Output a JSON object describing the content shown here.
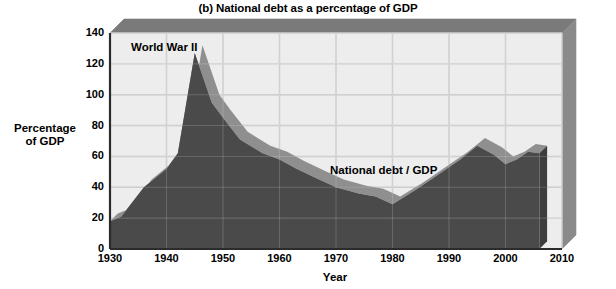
{
  "figure": {
    "title": "(b) National debt as a percentage of GDP",
    "xlabel": "Year",
    "ylabel_line1": "Percentage",
    "ylabel_line2": "of GDP"
  },
  "colors": {
    "area_fill": "#4a4a4a",
    "area_fill_side": "#3d3d3d",
    "plot_background": "#ededed",
    "gridline": "#c8c8c8",
    "frame_3d_top": "#7a7a7a",
    "frame_3d_side": "#8a8a8a",
    "axis_line": "#2b2b2b",
    "text": "#000000"
  },
  "annotations": [
    {
      "name": "world-war-2",
      "text": "World War II",
      "x": 1943,
      "y": 133
    },
    {
      "name": "series-label",
      "text": "National debt / GDP",
      "x": 1974,
      "y": 56
    }
  ],
  "chart_data": {
    "type": "area",
    "title": "(b) National debt as a percentage of GDP",
    "xlabel": "Year",
    "ylabel": "Percentage of GDP",
    "xlim": [
      1930,
      2010
    ],
    "ylim": [
      0,
      140
    ],
    "xticks": [
      1930,
      1940,
      1950,
      1960,
      1970,
      1980,
      1990,
      2000,
      2010
    ],
    "yticks": [
      0,
      20,
      40,
      60,
      80,
      100,
      120,
      140
    ],
    "grid": true,
    "legend": "none",
    "series": [
      {
        "name": "National debt / GDP",
        "x": [
          1930,
          1932,
          1936,
          1940,
          1942,
          1945,
          1948,
          1950,
          1953,
          1957,
          1960,
          1963,
          1967,
          1970,
          1974,
          1977,
          1980,
          1984,
          1988,
          1992,
          1995,
          1998,
          2000,
          2002,
          2004,
          2006
        ],
        "values": [
          18,
          21,
          40,
          52,
          62,
          127,
          95,
          85,
          71,
          62,
          58,
          52,
          45,
          40,
          36,
          34,
          29,
          38,
          48,
          58,
          67,
          61,
          55,
          58,
          63,
          62
        ]
      }
    ]
  }
}
